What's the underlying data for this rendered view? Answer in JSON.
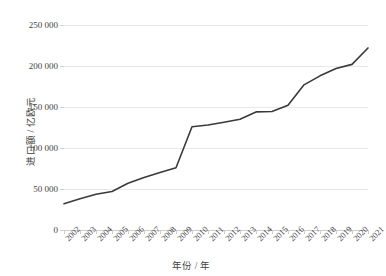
{
  "chart_data": {
    "type": "line",
    "title": "",
    "xlabel": "年份 / 年",
    "ylabel": "进口额 / 亿欧元",
    "categories": [
      "2002",
      "2003",
      "2004",
      "2005",
      "2006",
      "2007",
      "2008",
      "2009",
      "2010",
      "2011",
      "2012",
      "2013",
      "2014",
      "2015",
      "2016",
      "2017",
      "2018",
      "2019",
      "2020",
      "2021"
    ],
    "values": [
      32000,
      38000,
      43500,
      47000,
      57000,
      64000,
      70000,
      76000,
      126000,
      128000,
      131500,
      135000,
      144000,
      144500,
      152000,
      177000,
      188000,
      197000,
      202000,
      222000
    ],
    "ylim": [
      0,
      250000
    ],
    "ytick_labels": [
      "0",
      "50 000",
      "100 000",
      "150 000",
      "200 000",
      "250 000"
    ],
    "ytick_values": [
      0,
      50000,
      100000,
      150000,
      200000,
      250000
    ],
    "grid": true,
    "legend": "none",
    "series_color": "#3a3a3a",
    "gridline_color": "#e8e8e8",
    "axis_color": "#cfcfcf",
    "text_color": "#3f3f3f"
  }
}
